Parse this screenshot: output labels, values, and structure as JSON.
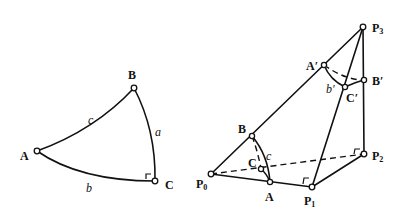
{
  "figure_left": {
    "title": "Spherical right triangle",
    "vertices": {
      "A": {
        "label": "A",
        "x": 37,
        "y": 151
      },
      "B": {
        "label": "B",
        "x": 134,
        "y": 88
      },
      "C": {
        "label": "C",
        "x": 155,
        "y": 181
      }
    },
    "sides": {
      "a": {
        "label": "a",
        "between": [
          "B",
          "C"
        ]
      },
      "b": {
        "label": "b",
        "between": [
          "A",
          "C"
        ]
      },
      "c": {
        "label": "c",
        "between": [
          "A",
          "B"
        ]
      }
    },
    "right_angle_at": "C"
  },
  "figure_right": {
    "title": "Tetrahedron construction",
    "points": {
      "P0": {
        "label": "P",
        "sub": "0",
        "x": 211,
        "y": 174
      },
      "P1": {
        "label": "P",
        "sub": "1",
        "x": 312,
        "y": 187
      },
      "P2": {
        "label": "P",
        "sub": "2",
        "x": 364,
        "y": 154
      },
      "P3": {
        "label": "P",
        "sub": "3",
        "x": 363,
        "y": 27
      },
      "A": {
        "label": "A",
        "x": 270,
        "y": 182
      },
      "B": {
        "label": "B",
        "x": 252,
        "y": 136
      },
      "C": {
        "label": "C",
        "x": 261,
        "y": 169
      },
      "A_prime": {
        "label": "A′",
        "x": 324,
        "y": 65
      },
      "B_prime": {
        "label": "B′",
        "x": 364,
        "y": 80
      },
      "C_prime": {
        "label": "C′",
        "x": 345,
        "y": 87
      }
    },
    "arc_labels": {
      "c": "c",
      "b_prime": "b′"
    },
    "solid_edges": [
      [
        "P0",
        "P1"
      ],
      [
        "P0",
        "P3"
      ],
      [
        "P1",
        "P2"
      ],
      [
        "P1",
        "P3"
      ],
      [
        "P2",
        "P3"
      ]
    ],
    "dashed_edges": [
      [
        "P0",
        "P2"
      ]
    ],
    "right_angles_at": [
      "P1",
      "P2"
    ]
  }
}
